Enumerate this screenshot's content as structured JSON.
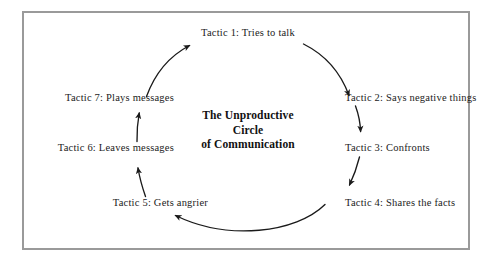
{
  "figure": {
    "type": "cycle-diagram",
    "center_title_lines": [
      "The Unproductive",
      "Circle",
      "of Communication"
    ],
    "frame_color": "#9a9a9a",
    "background_color": "#ffffff",
    "text_color": "#1b1b1b",
    "arrow_color": "#1a1a1a",
    "nodes": [
      {
        "id": "tactic-1",
        "label": "Tactic 1: Tries to talk",
        "position": "top"
      },
      {
        "id": "tactic-2",
        "label": "Tactic 2: Says negative things",
        "position": "upper-right"
      },
      {
        "id": "tactic-3",
        "label": "Tactic 3: Confronts",
        "position": "right"
      },
      {
        "id": "tactic-4",
        "label": "Tactic 4: Shares the facts",
        "position": "lower-right"
      },
      {
        "id": "tactic-5",
        "label": "Tactic 5: Gets angrier",
        "position": "lower-left"
      },
      {
        "id": "tactic-6",
        "label": "Tactic 6: Leaves messages",
        "position": "left"
      },
      {
        "id": "tactic-7",
        "label": "Tactic 7: Plays messages",
        "position": "upper-left"
      }
    ],
    "flow": [
      {
        "from": "tactic-1",
        "to": "tactic-2"
      },
      {
        "from": "tactic-2",
        "to": "tactic-3"
      },
      {
        "from": "tactic-3",
        "to": "tactic-4"
      },
      {
        "from": "tactic-4",
        "to": "tactic-5"
      },
      {
        "from": "tactic-5",
        "to": "tactic-6"
      },
      {
        "from": "tactic-6",
        "to": "tactic-7"
      },
      {
        "from": "tactic-7",
        "to": "tactic-1"
      }
    ]
  }
}
